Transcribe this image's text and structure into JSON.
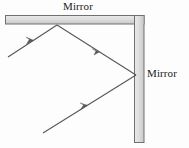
{
  "figure": {
    "type": "optics-ray-diagram",
    "width": 189,
    "height": 148,
    "background_color": "#fdfdfd",
    "labels": {
      "mirror_top": "Mirror",
      "mirror_right": "Mirror"
    },
    "colors": {
      "mirror_fill": "#d4d4d4",
      "mirror_fill_light": "#e8e8e8",
      "mirror_stroke": "#6b6b6b",
      "ray_stroke": "#555555",
      "label_text": "#1a1a1a"
    },
    "mirrors": [
      {
        "name": "top-horizontal-mirror",
        "orientation": "horizontal",
        "x": 5,
        "y": 15,
        "width": 139,
        "height": 9
      },
      {
        "name": "right-vertical-mirror",
        "orientation": "vertical",
        "x": 134,
        "y": 15,
        "width": 10,
        "height": 128
      }
    ],
    "rays": [
      {
        "name": "incident-ray",
        "from_x": 8,
        "from_y": 57,
        "to_x": 57,
        "to_y": 25,
        "arrow_at": 0.52,
        "arrow_direction": "up-right"
      },
      {
        "name": "first-reflected-ray",
        "from_x": 57,
        "from_y": 25,
        "to_x": 136,
        "to_y": 75,
        "arrow_at": 0.5,
        "arrow_direction": "down-right"
      },
      {
        "name": "second-reflected-ray",
        "from_x": 136,
        "from_y": 75,
        "to_x": 43,
        "to_y": 133,
        "arrow_at": 0.52,
        "arrow_direction": "down-left-travel"
      }
    ],
    "reflection_points": [
      {
        "name": "reflection-point-top-mirror",
        "x": 57,
        "y": 25
      },
      {
        "name": "reflection-point-right-mirror",
        "x": 136,
        "y": 75
      }
    ]
  }
}
